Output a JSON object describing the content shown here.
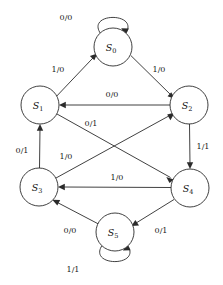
{
  "diagram": {
    "type": "state-transition-diagram",
    "title": "",
    "canvas": {
      "width": 223,
      "height": 285,
      "background": "#ffffff"
    },
    "style": {
      "stroke_color": "#2b2b2b",
      "node_fill": "#ffffff",
      "text_color": "#111111",
      "node_radius": 19
    },
    "nodes": [
      {
        "id": "S0",
        "label": "S",
        "subscript": "0",
        "cx": 113,
        "cy": 47
      },
      {
        "id": "S1",
        "label": "S",
        "subscript": "1",
        "cx": 40,
        "cy": 105
      },
      {
        "id": "S2",
        "label": "S",
        "subscript": "2",
        "cx": 189,
        "cy": 105
      },
      {
        "id": "S3",
        "label": "S",
        "subscript": "3",
        "cx": 39,
        "cy": 187
      },
      {
        "id": "S4",
        "label": "S",
        "subscript": "4",
        "cx": 190,
        "cy": 188
      },
      {
        "id": "S5",
        "label": "S",
        "subscript": "5",
        "cx": 115,
        "cy": 232
      }
    ],
    "edges": [
      {
        "id": "e-s0-s0",
        "from": "S0",
        "to": "S0",
        "label": "0/0",
        "kind": "self-loop",
        "label_x": 66,
        "label_y": 18
      },
      {
        "id": "e-s1-s0",
        "from": "S1",
        "to": "S0",
        "label": "1/0",
        "kind": "straight",
        "label_x": 58,
        "label_y": 70
      },
      {
        "id": "e-s0-s2",
        "from": "S0",
        "to": "S2",
        "label": "1/0",
        "kind": "straight",
        "label_x": 159,
        "label_y": 70
      },
      {
        "id": "e-s2-s1",
        "from": "S2",
        "to": "S1",
        "label": "0/0",
        "kind": "straight",
        "label_x": 112,
        "label_y": 95
      },
      {
        "id": "e-s1-s4",
        "from": "S1",
        "to": "S4",
        "label": "0/1",
        "kind": "straight",
        "label_x": 91,
        "label_y": 124
      },
      {
        "id": "e-s3-s2",
        "from": "S3",
        "to": "S2",
        "label": "1/0",
        "kind": "straight",
        "label_x": 66,
        "label_y": 157
      },
      {
        "id": "e-s2-s4",
        "from": "S2",
        "to": "S4",
        "label": "1/1",
        "kind": "straight",
        "label_x": 203,
        "label_y": 147
      },
      {
        "id": "e-s4-s3",
        "from": "S4",
        "to": "S3",
        "label": "1/0",
        "kind": "straight",
        "label_x": 117,
        "label_y": 178
      },
      {
        "id": "e-s3-s1",
        "from": "S3",
        "to": "S1",
        "label": "0/1",
        "kind": "straight",
        "label_x": 22,
        "label_y": 151
      },
      {
        "id": "e-s5-s3",
        "from": "S5",
        "to": "S3",
        "label": "0/0",
        "kind": "straight",
        "label_x": 70,
        "label_y": 231
      },
      {
        "id": "e-s4-s5",
        "from": "S4",
        "to": "S5",
        "label": "0/1",
        "kind": "straight",
        "label_x": 161,
        "label_y": 231
      },
      {
        "id": "e-s5-s5",
        "from": "S5",
        "to": "S5",
        "label": "1/1",
        "kind": "self-loop",
        "label_x": 73,
        "label_y": 270
      }
    ]
  }
}
